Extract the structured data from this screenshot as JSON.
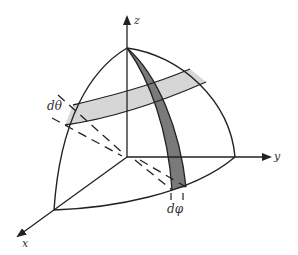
{
  "figure": {
    "axes": {
      "x_label": "x",
      "y_label": "y",
      "z_label": "z"
    },
    "annotations": {
      "d_theta": "dθ",
      "d_phi": "dφ"
    },
    "colors": {
      "line": "#222222",
      "theta_band": "#d6d6d6",
      "phi_band": "#7a7a7a",
      "background": "#ffffff"
    }
  }
}
